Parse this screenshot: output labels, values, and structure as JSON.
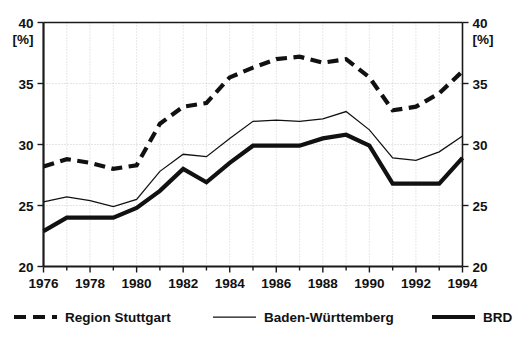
{
  "chart_data": {
    "type": "line",
    "title": "",
    "xlabel": "",
    "ylabel": "[%]",
    "unit_label_left": "[%]",
    "unit_label_right": "[%]",
    "grid": true,
    "legend_position": "bottom",
    "xlim": [
      1976,
      1994
    ],
    "ylim": [
      20,
      40
    ],
    "ytick_step": 5,
    "xtick_step": 1,
    "xtick_label_step": 2,
    "x": [
      1976,
      1977,
      1978,
      1979,
      1980,
      1981,
      1982,
      1983,
      1984,
      1985,
      1986,
      1987,
      1988,
      1989,
      1990,
      1991,
      1992,
      1993,
      1994
    ],
    "xticklabels": [
      "1976",
      "1978",
      "1980",
      "1982",
      "1984",
      "1986",
      "1988",
      "1990",
      "1992",
      "1994"
    ],
    "yticklabels_left": [
      "40",
      "35",
      "30",
      "25",
      "20"
    ],
    "yticklabels_right": [
      "40",
      "35",
      "30",
      "25",
      "20"
    ],
    "yticks": [
      40,
      35,
      30,
      25,
      20
    ],
    "series": [
      {
        "name": "Region Stuttgart",
        "style": "thick-dashed",
        "color": "#111111",
        "values": [
          28.2,
          28.8,
          28.5,
          28.0,
          28.3,
          31.7,
          33.1,
          33.4,
          35.5,
          36.3,
          37.0,
          37.2,
          36.7,
          37.0,
          35.5,
          32.8,
          33.1,
          34.2,
          36.0
        ]
      },
      {
        "name": "Baden-Württemberg",
        "style": "thin-solid",
        "color": "#111111",
        "values": [
          25.3,
          25.7,
          25.4,
          24.9,
          25.5,
          27.8,
          29.2,
          29.0,
          30.5,
          31.9,
          32.0,
          31.9,
          32.1,
          32.7,
          31.2,
          28.9,
          28.7,
          29.4,
          30.7
        ]
      },
      {
        "name": "BRD",
        "style": "thick-solid",
        "color": "#111111",
        "values": [
          22.9,
          24.0,
          24.0,
          24.0,
          24.8,
          26.2,
          28.0,
          26.9,
          28.5,
          29.9,
          29.9,
          29.9,
          30.5,
          30.8,
          29.9,
          26.8,
          26.8,
          26.8,
          28.9
        ]
      }
    ]
  },
  "legend": {
    "items": [
      {
        "label": "Region Stuttgart",
        "swatch": "thick-dashed-line-icon"
      },
      {
        "label": "Baden-Württemberg",
        "swatch": "thin-line-icon"
      },
      {
        "label": "BRD",
        "swatch": "thick-line-icon"
      }
    ]
  }
}
